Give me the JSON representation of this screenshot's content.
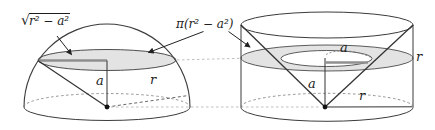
{
  "diagram": {
    "labels": {
      "radical_sign": "√",
      "radicand": "r² − a²",
      "section_area": "π(r² − a²)",
      "hemisphere": {
        "height": "a",
        "radius": "r"
      },
      "cylinder": {
        "axis_height": "a",
        "cone_section_radius": "a",
        "radius_side": "r",
        "base_radius": "r"
      }
    },
    "colors": {
      "line": "#3b3b3b",
      "section_fill": "#e3e3e3",
      "radius_segment": "#8f8f8f",
      "guide_dash": "#b8b8b8",
      "text": "#1e1e1e",
      "background": "#ffffff"
    }
  }
}
